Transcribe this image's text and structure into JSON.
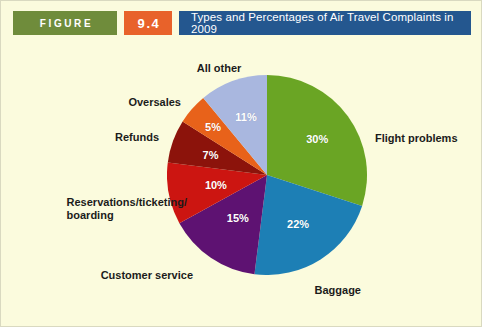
{
  "header": {
    "figure_label": "FIGURE",
    "figure_number": "9.4",
    "title": "Types and Percentages of Air Travel Complaints in 2009",
    "colors": {
      "figure_bg": "#6f8c3b",
      "number_bg": "#e8622a",
      "title_bg": "#24578f",
      "page_bg": "#fbfbdd"
    }
  },
  "chart_data": {
    "type": "pie",
    "title": "Types and Percentages of Air Travel Complaints in 2009",
    "xlabel": "",
    "ylabel": "",
    "legend": "none",
    "grid": false,
    "units": "percent",
    "start_angle_deg": 0,
    "direction": "clockwise",
    "categories": [
      "Flight problems",
      "Baggage",
      "Customer service",
      "Reservations/ticketing/boarding",
      "Refunds",
      "Oversales",
      "All other"
    ],
    "values": [
      30,
      22,
      15,
      10,
      7,
      5,
      11
    ],
    "value_labels": [
      "30%",
      "22%",
      "15%",
      "10%",
      "7%",
      "5%",
      "11%"
    ],
    "colors": [
      "#6aa524",
      "#1d7fb5",
      "#5e1272",
      "#cc1511",
      "#8c130b",
      "#e8621a",
      "#a9b7df"
    ],
    "slices": [
      {
        "name": "Flight problems",
        "value": 30,
        "value_label": "30%",
        "color": "#6aa524",
        "category_label": "Flight problems",
        "category_lines": [
          "Flight problems"
        ]
      },
      {
        "name": "Baggage",
        "value": 22,
        "value_label": "22%",
        "color": "#1d7fb5",
        "category_label": "Baggage",
        "category_lines": [
          "Baggage"
        ]
      },
      {
        "name": "Customer service",
        "value": 15,
        "value_label": "15%",
        "color": "#5e1272",
        "category_label": "Customer service",
        "category_lines": [
          "Customer service"
        ]
      },
      {
        "name": "Reservations/ticketing/boarding",
        "value": 10,
        "value_label": "10%",
        "color": "#cc1511",
        "category_label": "Reservations/ticketing/ boarding",
        "category_lines": [
          "Reservations/ticketing/",
          "boarding"
        ]
      },
      {
        "name": "Refunds",
        "value": 7,
        "value_label": "7%",
        "color": "#8c130b",
        "category_label": "Refunds",
        "category_lines": [
          "Refunds"
        ]
      },
      {
        "name": "Oversales",
        "value": 5,
        "value_label": "5%",
        "color": "#e8621a",
        "category_label": "Oversales",
        "category_lines": [
          "Oversales"
        ]
      },
      {
        "name": "All other",
        "value": 11,
        "value_label": "11%",
        "color": "#a9b7df",
        "category_label": "All other",
        "category_lines": [
          "All other"
        ]
      }
    ]
  }
}
